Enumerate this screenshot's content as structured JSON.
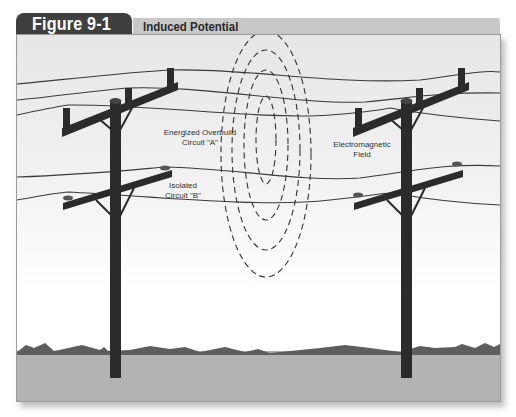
{
  "figure": {
    "number_label": "Figure 9-1",
    "title": "Induced Potential"
  },
  "labels": {
    "circuit_a_line1": "Energized Overbuild",
    "circuit_a_line2": "Circuit \"A\"",
    "circuit_b_line1": "Isolated",
    "circuit_b_line2": "Circuit \"B\"",
    "field_line1": "Electromagnetic",
    "field_line2": "Field"
  },
  "colors": {
    "tab_bg": "#3f3f3f",
    "subtitle_bg": "#c8c8c8",
    "pole": "#2b2b2b",
    "ground": "#b5b5b5",
    "hills": "#5e5e5e",
    "wire": "#3a3a3a"
  }
}
